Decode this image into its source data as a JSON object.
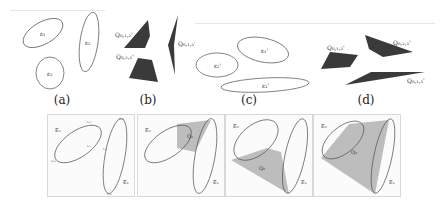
{
  "figure": {
    "top_row": [
      {
        "caption": "(a)",
        "description": "three disjoint ellipses",
        "labels": [
          "ε₁",
          "ε₂",
          "ε₃"
        ]
      },
      {
        "caption": "(b)",
        "description": "three dark polytopes",
        "labels": [
          "Q_{0,1,2}",
          "Q_{0,2,3}",
          "Q_{0,1,3}"
        ]
      },
      {
        "caption": "(c)",
        "description": "three ellipses (transformed)",
        "labels": [
          "ε₁'",
          "ε₂'",
          "ε₃'"
        ]
      },
      {
        "caption": "(d)",
        "description": "three dark polytopes (transformed)",
        "labels": [
          "Q_{0,1,2}'",
          "Q_{0,2,3}'",
          "Q_{0,1,3}'"
        ]
      }
    ],
    "bottom_row": [
      {
        "description": "two ellipses with tangent points",
        "ellipse_labels": [
          "E₀",
          "E₁"
        ],
        "point_labels": [
          "t₀₁₂",
          "t₀₂₃",
          "t₀₁",
          "t₁₀",
          "t₁₂₃",
          "t₁₃₀"
        ]
      },
      {
        "description": "two ellipses with small shaded region",
        "ellipse_labels": [
          "E₀",
          "E₁"
        ],
        "region_label": "Q₁"
      },
      {
        "description": "two ellipses with lower shaded region",
        "ellipse_labels": [
          "E₀",
          "E₁"
        ],
        "region_label": "Q₂"
      },
      {
        "description": "two ellipses with large shaded region",
        "ellipse_labels": [
          "E₀",
          "E₁"
        ],
        "region_label": "Q₃"
      }
    ],
    "colors": {
      "polytope_fill": "#3a3a3a",
      "shaded_region": "#bdbdbd",
      "ellipse_stroke": "#555555"
    }
  }
}
